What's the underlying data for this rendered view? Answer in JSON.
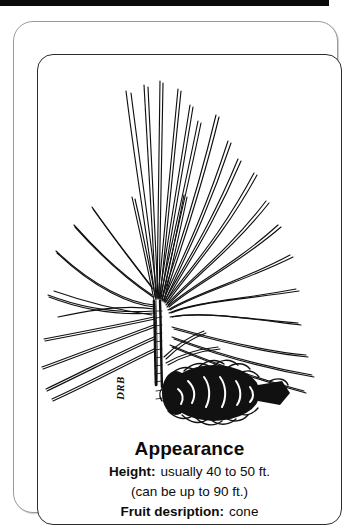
{
  "card": {
    "frame": {
      "outer_border_color": "#9a9a9a",
      "inner_border_color": "#2c2c2c",
      "background_color": "#ffffff"
    },
    "top_bar": {
      "color": "#0b0b0b"
    },
    "illustration": {
      "subject": "pine-branch-with-cone",
      "ink_color": "#111111",
      "description": "Hand-drawn ink illustration of a long-needle pine branch with a large pine cone at the base"
    },
    "signature": {
      "initials": "DRB"
    },
    "caption": {
      "title": "Appearance",
      "rows": [
        {
          "label": "Height:",
          "value": "usually 40 to 50 ft."
        },
        {
          "label": "",
          "value": "(can be up to 90 ft.)"
        },
        {
          "label": "Fruit desription:",
          "value": "cone"
        }
      ]
    }
  }
}
